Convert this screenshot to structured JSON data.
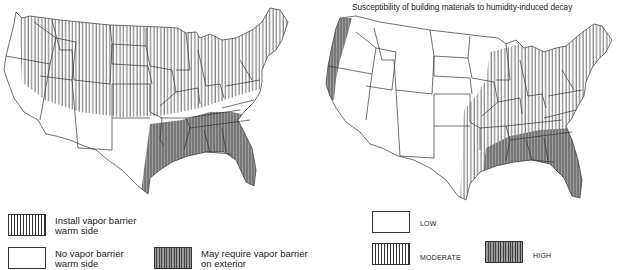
{
  "left_map": {
    "legend": [
      {
        "key": "install",
        "pattern": "vertical-lines",
        "label_line1": "Install vapor barrier",
        "label_line2": "warm side"
      },
      {
        "key": "none",
        "pattern": "blank",
        "label_line1": "No vapor barrier",
        "label_line2": "warm side"
      },
      {
        "key": "exterior",
        "pattern": "dense-shaded-lines",
        "label_line1": "May require vapor barrier",
        "label_line2": "on exterior"
      }
    ]
  },
  "right_map": {
    "title": "Susceptibility of building materials to humidity-induced decay",
    "legend": [
      {
        "key": "low",
        "pattern": "blank",
        "label": "LOW"
      },
      {
        "key": "moderate",
        "pattern": "vertical-lines",
        "label": "MODERATE"
      },
      {
        "key": "high",
        "pattern": "dense-shaded-lines",
        "label": "HIGH"
      }
    ]
  },
  "colors": {
    "outline": "#333333",
    "hatch": "#333333",
    "shade": "#9a9a9a",
    "background": "#ffffff"
  }
}
